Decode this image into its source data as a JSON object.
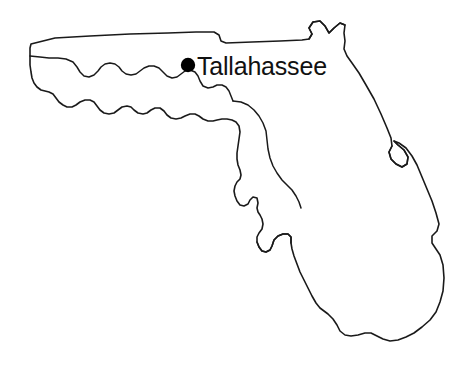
{
  "figure": {
    "type": "map",
    "background_color": "#ffffff",
    "outline_color": "#1a1a1a",
    "width": 475,
    "height": 371
  },
  "city": {
    "name": "Tallahassee",
    "marker": "filled-circle",
    "marker_color": "#000000",
    "marker_x": 188,
    "marker_y": 65,
    "marker_radius": 7,
    "label_x": 198,
    "label_y": 75
  },
  "highlight": {
    "name": "hatched-region",
    "pattern": "diagonal-hatch",
    "pattern_color": "#111111",
    "pattern_angle_deg": 45,
    "pattern_spacing_px": 7,
    "x_range": [
      248,
      322
    ],
    "y_range": [
      100,
      208
    ]
  },
  "geometry": {
    "state_outline_path": "M 31 44 L 54 39 L 120 36 L 175 33 L 199 32 L 218 33 L 222 40 L 225 43 L 252 42 L 288 40 L 308 40 L 312 36 L 309 29 L 314 22 L 320 21 L 326 26 L 330 32 L 336 28 L 341 24 L 345 26 L 344 33 L 346 40 L 345 49 L 348 56 L 353 62 L 360 73 L 366 84 L 374 98 L 382 113 L 389 127 L 392 136 L 393 143 L 390 150 L 392 157 L 397 163 L 403 166 L 408 163 L 409 156 L 405 149 L 399 144 L 395 140 L 399 142 L 406 147 L 412 154 L 417 163 L 421 174 L 426 186 L 431 197 L 436 210 L 439 221 L 438 229 L 433 234 L 432 241 L 436 247 L 440 252 L 443 262 L 444 276 L 444 290 L 441 300 L 437 310 L 431 318 L 424 325 L 416 331 L 408 336 L 401 339 L 394 341 L 386 341 L 379 338 L 373 334 L 368 332 L 362 333 L 355 335 L 348 336 L 342 335 L 338 331 L 336 325 L 332 319 L 327 314 L 323 311 L 319 308 L 315 303 L 311 296 L 307 289 L 303 282 L 299 274 L 296 266 L 293 259 L 291 253 L 290 247 L 289 241 L 289 236 L 286 233 L 281 233 L 276 235 L 272 239 L 270 245 L 268 249 L 265 251 L 261 250 L 258 246 L 256 241 L 256 236 L 258 232 L 261 228 L 262 223 L 261 218 L 259 214 L 257 211 L 256 207 L 257 202 L 256 197 L 252 196 L 249 199 L 247 203 L 243 205 L 239 204 L 236 200 L 234 195 L 233 190 L 234 185 L 236 181 L 239 178 L 240 174 L 239 169 L 237 164 L 236 158 L 236 152 L 237 145 L 238 138 L 239 131 L 238 125 L 235 121 L 231 119 L 226 118 L 221 118 L 216 119 L 212 120 L 207 120 L 202 118 L 198 115 L 194 113 L 189 113 L 184 115 L 180 117 L 175 118 L 170 117 L 166 114 L 163 110 L 159 107 L 154 107 L 150 109 L 146 112 L 142 113 L 137 112 L 133 109 L 130 106 L 126 105 L 121 106 L 117 109 L 113 112 L 108 113 L 103 112 L 99 109 L 96 105 L 93 101 L 89 99 L 84 99 L 79 101 L 75 104 L 71 106 L 66 106 L 62 104 L 58 101 L 55 97 L 52 93 L 48 91 L 44 90 L 40 89 L 36 86 L 33 82 L 31 77 L 30 72 L 30 66 L 30 58 L 30 50 Z",
    "panhandle_inner_path": "M 30 56 L 40 57 L 49 58 L 58 58 L 66 59 L 73 62 L 77 67 L 80 72 L 84 76 L 89 77 L 94 75 L 98 71 L 101 67 L 105 64 L 110 63 L 115 64 L 119 67 L 122 71 L 126 74 L 131 75 L 136 74 L 140 71 L 144 68 L 149 66 L 154 66 L 159 68 L 163 72 L 167 76 L 172 78 L 177 77 L 181 74 L 185 71 L 190 70 L 195 72 L 198 76 L 200 81 L 203 86 L 208 88 L 213 87 L 217 85 L 222 85 L 226 87 L 229 91 L 231 96 L 233 101",
    "note": "Outline path is an approximation of the Florida state boundary as traced in the source image."
  },
  "gulf_coast_hatch_boundary": {
    "path": "M 233 101 L 240 102 L 247 104 L 253 108 L 258 113 L 262 119 L 265 126 L 267 133 L 268 141 L 269 149 L 271 157 L 274 165 L 278 172 L 283 178 L 288 183 L 293 188 L 297 193 L 300 199 L 302 205"
  }
}
